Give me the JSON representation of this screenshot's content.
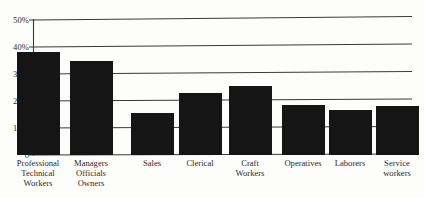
{
  "chart_data": {
    "type": "bar",
    "title": "",
    "subtitle": "",
    "xlabel": "",
    "ylabel": "",
    "ylim": [
      0,
      50
    ],
    "grid": true,
    "legend": "none",
    "orientation": "vertical",
    "bar_color": "#151515",
    "background_color": "#fdfdfb",
    "axis_color": "#2b2b2b",
    "categories": [
      "Professional\nTechnical\nWorkers",
      "Managers\nOfficials\nOwners",
      "Sales",
      "Clerical",
      "Craft\nWorkers",
      "Operatives",
      "Laborers",
      "Service\nworkers"
    ],
    "values": [
      38,
      35,
      15.5,
      23,
      25.5,
      18.5,
      16.5,
      18
    ],
    "yticks": [
      0,
      10,
      20,
      30,
      40,
      50
    ],
    "ytick_labels": [
      "0",
      "10%",
      "20%",
      "30%",
      "40%",
      "50%"
    ]
  }
}
